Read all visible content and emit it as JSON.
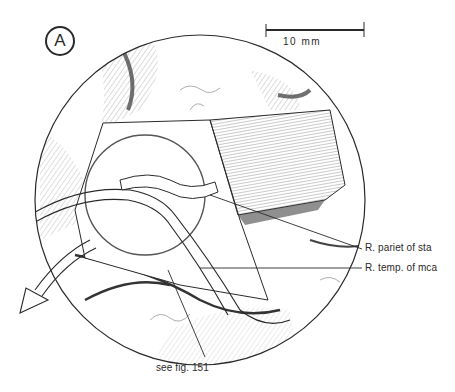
{
  "figure": {
    "panel_letter": "A",
    "scale_bar": {
      "label": "10 mm",
      "length_px": 98
    },
    "callouts": [
      {
        "id": "pariet",
        "text": "R. pariet of sta"
      },
      {
        "id": "temp",
        "text": "R. temp. of mca"
      },
      {
        "id": "see_fig",
        "text": "see  fig. 151"
      }
    ],
    "arrow": {
      "direction": "down-left"
    },
    "colors": {
      "ink": "#2a2a2a",
      "paper": "#ffffff",
      "shade": "#555555"
    }
  }
}
